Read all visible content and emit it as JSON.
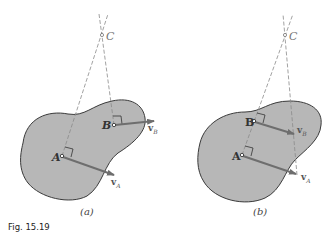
{
  "figure": {
    "caption": "Fig. 15.19",
    "panels": [
      {
        "id": "a",
        "label": "(a)",
        "points": {
          "A": "A",
          "B": "B",
          "C": "C"
        },
        "vectors": {
          "vA": "v",
          "vA_sub": "A",
          "vB": "v",
          "vB_sub": "B"
        }
      },
      {
        "id": "b",
        "label": "(b)",
        "points": {
          "A": "A",
          "B": "B",
          "C": "C"
        },
        "vectors": {
          "vA": "v",
          "vA_sub": "A",
          "vB": "v",
          "vB_sub": "B"
        }
      }
    ]
  },
  "colors": {
    "body_fill": "#b7b7b7",
    "body_stroke": "#3a3a3a",
    "vector": "#6e6e6e",
    "dashed": "#8a8a8a"
  }
}
